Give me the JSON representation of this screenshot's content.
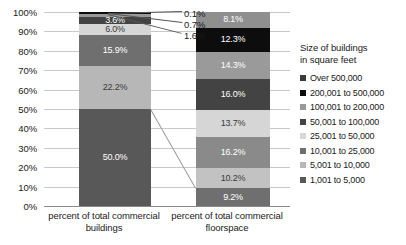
{
  "chart_data": {
    "type": "bar",
    "stacked": true,
    "title": "",
    "xlabel": "",
    "ylabel": "",
    "ylim": [
      0,
      100
    ],
    "grid": true,
    "legend_position": "right",
    "legend_title": "Size of buildings in square feet",
    "categories": [
      "percent of total commercial buildings",
      "percent of total commercial floorspace"
    ],
    "series": [
      {
        "name": "Over 500,000",
        "color": "#3b3b3b",
        "values": [
          0.1,
          8.1
        ]
      },
      {
        "name": "200,001 to 500,000",
        "color": "#0d0d0d",
        "values": [
          0.7,
          12.3
        ]
      },
      {
        "name": "100,001 to 200,000",
        "color": "#9a9a9a",
        "values": [
          1.6,
          14.3
        ]
      },
      {
        "name": "50,001 to 100,000",
        "color": "#434343",
        "values": [
          3.6,
          16.0
        ]
      },
      {
        "name": "25,001 to 50,000",
        "color": "#d6d6d6",
        "values": [
          6.0,
          13.7
        ]
      },
      {
        "name": "10,001 to 25,000",
        "color": "#6f6f6f",
        "values": [
          15.9,
          16.2
        ]
      },
      {
        "name": "5,001 to 10,000",
        "color": "#b7b7b7",
        "values": [
          22.2,
          10.2
        ]
      },
      {
        "name": "1,001 to 5,000",
        "color": "#585858",
        "values": [
          50.0,
          9.2
        ]
      }
    ],
    "y_ticks": [
      "0%",
      "10%",
      "20%",
      "30%",
      "40%",
      "50%",
      "60%",
      "70%",
      "80%",
      "90%",
      "100%"
    ],
    "bar1_labels": [
      "0.1%",
      "0.7%",
      "1.6%",
      "3.6%",
      "6.0%",
      "15.9%",
      "22.2%",
      "50.0%"
    ],
    "bar2_labels": [
      "8.1%",
      "12.3%",
      "14.3%",
      "16.0%",
      "13.7%",
      "16.2%",
      "10.2%",
      "9.2%"
    ],
    "callouts": [
      "0.1%",
      "0.7%",
      "1.6%"
    ]
  },
  "axis": {
    "y_ticks": [
      {
        "label": "100%",
        "value": 100
      },
      {
        "label": "90%",
        "value": 90
      },
      {
        "label": "80%",
        "value": 80
      },
      {
        "label": "70%",
        "value": 70
      },
      {
        "label": "60%",
        "value": 60
      },
      {
        "label": "50%",
        "value": 50
      },
      {
        "label": "40%",
        "value": 40
      },
      {
        "label": "30%",
        "value": 30
      },
      {
        "label": "20%",
        "value": 20
      },
      {
        "label": "10%",
        "value": 10
      },
      {
        "label": "0%",
        "value": 0
      }
    ]
  },
  "x_axis": {
    "label1_line1": "percent of total commercial",
    "label1_line2": "buildings",
    "label2_line1": "percent of total commercial",
    "label2_line2": "floorspace"
  },
  "legend": {
    "title_line1": "Size of buildings",
    "title_line2": "in square feet",
    "items": [
      {
        "label": "Over 500,000",
        "color": "#3b3b3b"
      },
      {
        "label": "200,001 to 500,000",
        "color": "#0d0d0d"
      },
      {
        "label": "100,001 to 200,000",
        "color": "#9a9a9a"
      },
      {
        "label": "50,001 to 100,000",
        "color": "#434343"
      },
      {
        "label": "25,001 to 50,000",
        "color": "#d6d6d6"
      },
      {
        "label": "10,001 to 25,000",
        "color": "#6f6f6f"
      },
      {
        "label": "5,001 to 10,000",
        "color": "#b7b7b7"
      },
      {
        "label": "1,001 to 5,000",
        "color": "#585858"
      }
    ]
  },
  "bar1": {
    "segments": [
      {
        "label": "0.1%",
        "value": 0.1,
        "color": "#3b3b3b",
        "show_inline": false,
        "label_dark": false
      },
      {
        "label": "0.7%",
        "value": 0.7,
        "color": "#0d0d0d",
        "show_inline": false,
        "label_dark": false
      },
      {
        "label": "1.6%",
        "value": 1.6,
        "color": "#9a9a9a",
        "show_inline": false,
        "label_dark": false
      },
      {
        "label": "3.6%",
        "value": 3.6,
        "color": "#434343",
        "show_inline": true,
        "label_dark": false
      },
      {
        "label": "6.0%",
        "value": 6.0,
        "color": "#d6d6d6",
        "show_inline": true,
        "label_dark": true
      },
      {
        "label": "15.9%",
        "value": 15.9,
        "color": "#6f6f6f",
        "show_inline": true,
        "label_dark": false
      },
      {
        "label": "22.2%",
        "value": 22.2,
        "color": "#b7b7b7",
        "show_inline": true,
        "label_dark": true
      },
      {
        "label": "50.0%",
        "value": 50.0,
        "color": "#585858",
        "show_inline": true,
        "label_dark": false
      }
    ]
  },
  "bar2": {
    "segments": [
      {
        "label": "8.1%",
        "value": 8.1,
        "color": "#8f8f8f",
        "show_inline": true,
        "label_dark": false
      },
      {
        "label": "12.3%",
        "value": 12.3,
        "color": "#0d0d0d",
        "show_inline": true,
        "label_dark": false
      },
      {
        "label": "14.3%",
        "value": 14.3,
        "color": "#9a9a9a",
        "show_inline": true,
        "label_dark": false
      },
      {
        "label": "16.0%",
        "value": 16.0,
        "color": "#434343",
        "show_inline": true,
        "label_dark": false
      },
      {
        "label": "13.7%",
        "value": 13.7,
        "color": "#d6d6d6",
        "show_inline": true,
        "label_dark": true
      },
      {
        "label": "16.2%",
        "value": 16.2,
        "color": "#8a8a8a",
        "show_inline": true,
        "label_dark": false
      },
      {
        "label": "10.2%",
        "value": 10.2,
        "color": "#c2c2c2",
        "show_inline": true,
        "label_dark": true
      },
      {
        "label": "9.2%",
        "value": 9.2,
        "color": "#6f6f6f",
        "show_inline": true,
        "label_dark": false
      }
    ]
  }
}
